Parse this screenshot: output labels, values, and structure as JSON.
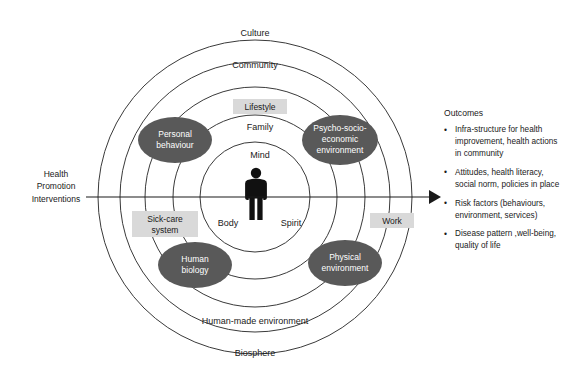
{
  "diagram": {
    "rings": [
      {
        "label": "Culture",
        "radius": 157,
        "label_y": 36
      },
      {
        "label": "Community",
        "radius": 135,
        "label_y": 66
      },
      {
        "label": "Human-made environment",
        "radius": 110,
        "label_y": 322
      },
      {
        "label": "Biosphere",
        "radius": 82,
        "label_y": 352
      }
    ],
    "ring_labels_top": [
      "Culture",
      "Community"
    ],
    "ring_labels_bottom": [
      "Human-made environment",
      "Biosphere"
    ],
    "ring_radii": [
      157,
      135,
      110,
      82,
      55
    ],
    "center": {
      "x": 255,
      "y": 197
    },
    "ellipses": [
      {
        "label_line1": "Personal",
        "label_line2": "behaviour",
        "cx": 175,
        "cy": 140
      },
      {
        "label_line1": "Psycho-socio-",
        "label_line2": "economic",
        "label_line3": "environment",
        "cx": 340,
        "cy": 140
      },
      {
        "label_line1": "Human",
        "label_line2": "biology",
        "cx": 195,
        "cy": 265
      },
      {
        "label_line1": "Physical",
        "label_line2": "environment",
        "cx": 345,
        "cy": 263
      }
    ],
    "boxes": [
      {
        "label": "Lifestyle",
        "cx": 260,
        "cy": 108
      },
      {
        "label": "Sick-care system",
        "line1": "Sick-care",
        "line2": "system",
        "cx": 165,
        "cy": 224
      },
      {
        "label": "Work",
        "cx": 392,
        "cy": 221
      }
    ],
    "plain_labels": [
      {
        "text": "Family",
        "cx": 260,
        "cy": 127
      },
      {
        "text": "Mind",
        "cx": 260,
        "cy": 155
      },
      {
        "text": "Body",
        "cx": 228,
        "cy": 222
      },
      {
        "text": "Spirit",
        "cx": 290,
        "cy": 222
      }
    ],
    "intervention": {
      "line1": "Health",
      "line2": "Promotion",
      "line3": "Interventions"
    },
    "arrow": {
      "x_start": 86,
      "x_end": 438,
      "y": 197,
      "direction": "right"
    },
    "colors": {
      "ellipse_fill": "#595959",
      "ellipse_text": "#ffffff",
      "box_fill": "#d9d9d9",
      "ring_stroke": "#3a3a3a",
      "text": "#1a1a1a",
      "background": "#ffffff"
    }
  },
  "outcomes": {
    "title": "Outcomes",
    "items": [
      "Infra-structure for health improvement, health actions in community",
      "Attitudes, health literacy, social norm, policies in place",
      "Risk factors (behaviours, environment, services)",
      "Disease pattern ,well-being, quality of life"
    ]
  }
}
